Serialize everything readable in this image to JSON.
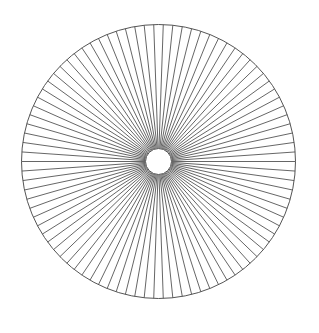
{
  "diagram": {
    "type": "radial-spoke-pattern",
    "center": {
      "x": 158.5,
      "y": 161.5
    },
    "outer_radius": 137,
    "inner_radius": 13,
    "spoke_count": 90,
    "colors": {
      "background": "#ffffff",
      "stroke": "#555555",
      "inner_fill": "#ffffff"
    },
    "stroke_width": 0.9
  }
}
